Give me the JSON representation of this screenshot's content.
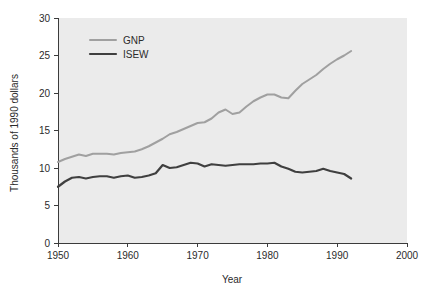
{
  "chart_data": {
    "type": "line",
    "title": "",
    "xlabel": "Year",
    "ylabel": "Thousands of 1990 dollars",
    "xlim": [
      1950,
      2000
    ],
    "ylim": [
      0,
      30
    ],
    "xticks": [
      1950,
      1960,
      1970,
      1980,
      1990,
      2000
    ],
    "xtick_labels": [
      "1950",
      "1960",
      "1970",
      "1980",
      "1990",
      "2000"
    ],
    "yticks": [
      0,
      5,
      10,
      15,
      20,
      25,
      30
    ],
    "ytick_labels": [
      "0",
      "5",
      "10",
      "15",
      "20",
      "25",
      "30"
    ],
    "grid": false,
    "legend_position": "upper-left",
    "background_color": "#ebebeb",
    "series": [
      {
        "name": "GNP",
        "color": "#a0a0a0",
        "line_width": 2.0,
        "x": [
          1950,
          1951,
          1952,
          1953,
          1954,
          1955,
          1956,
          1957,
          1958,
          1959,
          1960,
          1961,
          1962,
          1963,
          1964,
          1965,
          1966,
          1967,
          1968,
          1969,
          1970,
          1971,
          1972,
          1973,
          1974,
          1975,
          1976,
          1977,
          1978,
          1979,
          1980,
          1981,
          1982,
          1983,
          1984,
          1985,
          1986,
          1987,
          1988,
          1989,
          1990,
          1991,
          1992
        ],
        "values": [
          10.8,
          11.2,
          11.5,
          11.8,
          11.6,
          11.9,
          11.9,
          11.9,
          11.8,
          12.0,
          12.1,
          12.2,
          12.5,
          12.9,
          13.4,
          13.9,
          14.5,
          14.8,
          15.2,
          15.6,
          16.0,
          16.1,
          16.6,
          17.4,
          17.8,
          17.2,
          17.4,
          18.2,
          18.9,
          19.4,
          19.8,
          19.8,
          19.4,
          19.3,
          20.3,
          21.2,
          21.8,
          22.4,
          23.2,
          23.9,
          24.5,
          25.0,
          25.6
        ],
        "label_end": 25.6
      },
      {
        "name": "ISEW",
        "color": "#3f3f3f",
        "line_width": 2.2,
        "x": [
          1950,
          1951,
          1952,
          1953,
          1954,
          1955,
          1956,
          1957,
          1958,
          1959,
          1960,
          1961,
          1962,
          1963,
          1964,
          1965,
          1966,
          1967,
          1968,
          1969,
          1970,
          1971,
          1972,
          1973,
          1974,
          1975,
          1976,
          1977,
          1978,
          1979,
          1980,
          1981,
          1982,
          1983,
          1984,
          1985,
          1986,
          1987,
          1988,
          1989,
          1990,
          1991,
          1992
        ],
        "values": [
          7.5,
          8.2,
          8.7,
          8.8,
          8.6,
          8.8,
          8.9,
          8.9,
          8.7,
          8.9,
          9.0,
          8.7,
          8.8,
          9.0,
          9.3,
          10.4,
          10.0,
          10.1,
          10.4,
          10.7,
          10.6,
          10.2,
          10.5,
          10.4,
          10.3,
          10.4,
          10.5,
          10.5,
          10.5,
          10.6,
          10.6,
          10.7,
          10.2,
          9.9,
          9.5,
          9.4,
          9.5,
          9.6,
          9.9,
          9.6,
          9.4,
          9.2,
          8.6
        ],
        "label_end": 8.6
      }
    ],
    "legend": [
      {
        "label": "GNP",
        "color": "#a0a0a0"
      },
      {
        "label": "ISEW",
        "color": "#3f3f3f"
      }
    ]
  }
}
